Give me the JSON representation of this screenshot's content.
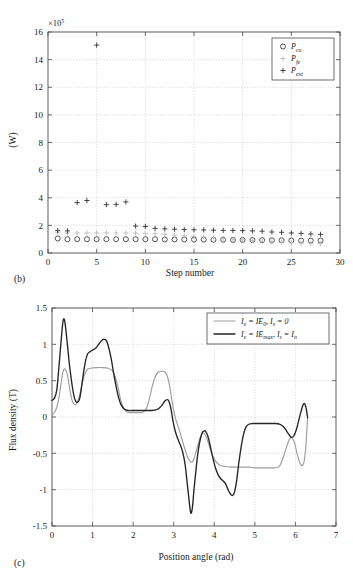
{
  "figure": {
    "panel_b_label": "(b)",
    "panel_c_label": "(c)"
  },
  "chart_data": [
    {
      "id": "panel-b",
      "type": "scatter",
      "title": "",
      "xlabel": "Step number",
      "ylabel": "(W)",
      "y_exponent_label": "×10",
      "y_exponent_sup": "5",
      "xlim": [
        0,
        30
      ],
      "ylim": [
        0,
        16
      ],
      "xticks": [
        0,
        5,
        10,
        15,
        20,
        25,
        30
      ],
      "yticks": [
        0,
        2,
        4,
        6,
        8,
        10,
        12,
        14,
        16
      ],
      "grid": true,
      "legend_position": "top-right",
      "legend": [
        {
          "marker": "circle",
          "base": "P",
          "sub": "cu"
        },
        {
          "marker": "plus-gray",
          "base": "P",
          "sub": "fe"
        },
        {
          "marker": "plus",
          "base": "P",
          "sub": "ext"
        }
      ],
      "x": [
        1,
        2,
        3,
        4,
        5,
        6,
        7,
        8,
        9,
        10,
        11,
        12,
        13,
        14,
        15,
        16,
        17,
        18,
        19,
        20,
        21,
        22,
        23,
        24,
        25,
        26,
        27,
        28
      ],
      "series": [
        {
          "name": "P_cu",
          "marker": "circle",
          "values": [
            1.05,
            1.0,
            1.0,
            1.0,
            1.0,
            1.0,
            1.0,
            1.0,
            1.0,
            1.0,
            1.0,
            0.98,
            0.98,
            0.98,
            0.97,
            0.97,
            0.96,
            0.96,
            0.95,
            0.95,
            0.94,
            0.93,
            0.92,
            0.92,
            0.91,
            0.9,
            0.9,
            0.9
          ]
        },
        {
          "name": "P_fe",
          "marker": "plus-gray",
          "values": [
            1.5,
            1.45,
            1.45,
            1.45,
            1.45,
            1.45,
            1.45,
            1.45,
            1.45,
            1.42,
            1.4,
            1.35,
            1.3,
            1.25,
            1.2,
            1.15,
            1.1,
            1.05,
            1.0,
            0.95,
            0.9,
            0.85,
            0.8,
            0.78,
            0.75,
            0.72,
            0.7,
            0.68
          ]
        },
        {
          "name": "P_ext",
          "marker": "plus",
          "values": [
            1.62,
            1.6,
            3.65,
            3.8,
            15.05,
            3.5,
            3.52,
            3.7,
            1.95,
            1.92,
            1.78,
            1.75,
            1.72,
            1.7,
            1.68,
            1.67,
            1.65,
            1.64,
            1.63,
            1.62,
            1.6,
            1.58,
            1.52,
            1.5,
            1.45,
            1.42,
            1.38,
            1.35
          ]
        }
      ]
    },
    {
      "id": "panel-c",
      "type": "line",
      "title": "",
      "xlabel": "Position angle (rad)",
      "ylabel": "Flux density (T)",
      "xlim": [
        0,
        7
      ],
      "ylim": [
        -1.5,
        1.5
      ],
      "xticks": [
        0,
        1,
        2,
        3,
        4,
        5,
        6,
        7
      ],
      "yticks": [
        -1.5,
        -1,
        -0.5,
        0,
        0.5,
        1,
        1.5
      ],
      "ytick_labels": [
        "-1.5",
        "-1",
        "-0.5",
        "0",
        "0.5",
        "1",
        "1.5"
      ],
      "grid": true,
      "legend_position": "top-right",
      "legend": [
        {
          "color": "#9d9d9d",
          "label_parts": [
            "I",
            "e",
            " = IE",
            "0",
            ", I",
            "s",
            " = 0"
          ]
        },
        {
          "color": "#242424",
          "label_parts": [
            "I",
            "e",
            " = IE",
            "max",
            ", I",
            "s",
            " = I",
            "n"
          ]
        }
      ],
      "series": [
        {
          "name": "Ie = IE0, Is = 0",
          "color": "#9d9d9d",
          "points": [
            [
              0.0,
              0.03
            ],
            [
              0.08,
              0.08
            ],
            [
              0.15,
              0.2
            ],
            [
              0.22,
              0.45
            ],
            [
              0.27,
              0.62
            ],
            [
              0.32,
              0.66
            ],
            [
              0.38,
              0.58
            ],
            [
              0.44,
              0.38
            ],
            [
              0.5,
              0.22
            ],
            [
              0.56,
              0.17
            ],
            [
              0.62,
              0.2
            ],
            [
              0.68,
              0.3
            ],
            [
              0.74,
              0.45
            ],
            [
              0.8,
              0.58
            ],
            [
              0.86,
              0.65
            ],
            [
              0.95,
              0.67
            ],
            [
              1.1,
              0.68
            ],
            [
              1.25,
              0.68
            ],
            [
              1.38,
              0.67
            ],
            [
              1.48,
              0.64
            ],
            [
              1.56,
              0.55
            ],
            [
              1.63,
              0.4
            ],
            [
              1.7,
              0.22
            ],
            [
              1.77,
              0.12
            ],
            [
              1.85,
              0.07
            ],
            [
              1.95,
              0.06
            ],
            [
              2.05,
              0.06
            ],
            [
              2.15,
              0.06
            ],
            [
              2.25,
              0.07
            ],
            [
              2.33,
              0.12
            ],
            [
              2.4,
              0.25
            ],
            [
              2.47,
              0.42
            ],
            [
              2.55,
              0.56
            ],
            [
              2.62,
              0.62
            ],
            [
              2.7,
              0.63
            ],
            [
              2.78,
              0.62
            ],
            [
              2.85,
              0.55
            ],
            [
              2.9,
              0.42
            ],
            [
              2.95,
              0.25
            ],
            [
              3.0,
              0.08
            ],
            [
              3.06,
              -0.05
            ],
            [
              3.12,
              -0.15
            ],
            [
              3.2,
              -0.3
            ],
            [
              3.28,
              -0.45
            ],
            [
              3.35,
              -0.56
            ],
            [
              3.42,
              -0.62
            ],
            [
              3.48,
              -0.6
            ],
            [
              3.54,
              -0.5
            ],
            [
              3.6,
              -0.38
            ],
            [
              3.66,
              -0.27
            ],
            [
              3.72,
              -0.22
            ],
            [
              3.78,
              -0.25
            ],
            [
              3.85,
              -0.35
            ],
            [
              3.92,
              -0.48
            ],
            [
              4.0,
              -0.58
            ],
            [
              4.08,
              -0.64
            ],
            [
              4.16,
              -0.67
            ],
            [
              4.26,
              -0.68
            ],
            [
              4.4,
              -0.69
            ],
            [
              4.55,
              -0.69
            ],
            [
              4.7,
              -0.69
            ],
            [
              4.85,
              -0.69
            ],
            [
              5.0,
              -0.7
            ],
            [
              5.15,
              -0.7
            ],
            [
              5.3,
              -0.7
            ],
            [
              5.45,
              -0.7
            ],
            [
              5.58,
              -0.69
            ],
            [
              5.66,
              -0.62
            ],
            [
              5.73,
              -0.5
            ],
            [
              5.8,
              -0.38
            ],
            [
              5.86,
              -0.3
            ],
            [
              5.92,
              -0.29
            ],
            [
              5.98,
              -0.36
            ],
            [
              6.04,
              -0.5
            ],
            [
              6.1,
              -0.62
            ],
            [
              6.16,
              -0.67
            ],
            [
              6.21,
              -0.62
            ],
            [
              6.25,
              -0.45
            ],
            [
              6.28,
              -0.2
            ],
            [
              6.3,
              -0.02
            ]
          ]
        },
        {
          "name": "Ie = IEmax, Is = In",
          "color": "#242424",
          "points": [
            [
              0.0,
              0.23
            ],
            [
              0.06,
              0.26
            ],
            [
              0.12,
              0.38
            ],
            [
              0.18,
              0.75
            ],
            [
              0.24,
              1.15
            ],
            [
              0.28,
              1.34
            ],
            [
              0.32,
              1.3
            ],
            [
              0.37,
              1.05
            ],
            [
              0.43,
              0.72
            ],
            [
              0.5,
              0.42
            ],
            [
              0.56,
              0.25
            ],
            [
              0.62,
              0.2
            ],
            [
              0.68,
              0.25
            ],
            [
              0.73,
              0.42
            ],
            [
              0.78,
              0.62
            ],
            [
              0.83,
              0.78
            ],
            [
              0.88,
              0.87
            ],
            [
              0.94,
              0.9
            ],
            [
              1.0,
              0.92
            ],
            [
              1.08,
              0.95
            ],
            [
              1.15,
              1.0
            ],
            [
              1.22,
              1.05
            ],
            [
              1.28,
              1.07
            ],
            [
              1.34,
              1.05
            ],
            [
              1.4,
              0.95
            ],
            [
              1.46,
              0.8
            ],
            [
              1.52,
              0.6
            ],
            [
              1.58,
              0.42
            ],
            [
              1.64,
              0.27
            ],
            [
              1.7,
              0.17
            ],
            [
              1.78,
              0.11
            ],
            [
              1.88,
              0.09
            ],
            [
              2.0,
              0.09
            ],
            [
              2.15,
              0.09
            ],
            [
              2.3,
              0.09
            ],
            [
              2.45,
              0.09
            ],
            [
              2.58,
              0.1
            ],
            [
              2.66,
              0.13
            ],
            [
              2.72,
              0.17
            ],
            [
              2.78,
              0.22
            ],
            [
              2.84,
              0.24
            ],
            [
              2.88,
              0.22
            ],
            [
              2.93,
              0.12
            ],
            [
              2.98,
              -0.05
            ],
            [
              3.04,
              -0.2
            ],
            [
              3.1,
              -0.3
            ],
            [
              3.16,
              -0.38
            ],
            [
              3.22,
              -0.48
            ],
            [
              3.28,
              -0.65
            ],
            [
              3.33,
              -0.9
            ],
            [
              3.38,
              -1.15
            ],
            [
              3.42,
              -1.32
            ],
            [
              3.46,
              -1.25
            ],
            [
              3.5,
              -1.0
            ],
            [
              3.55,
              -0.72
            ],
            [
              3.6,
              -0.48
            ],
            [
              3.65,
              -0.32
            ],
            [
              3.7,
              -0.22
            ],
            [
              3.75,
              -0.19
            ],
            [
              3.8,
              -0.21
            ],
            [
              3.86,
              -0.3
            ],
            [
              3.92,
              -0.45
            ],
            [
              3.98,
              -0.6
            ],
            [
              4.04,
              -0.72
            ],
            [
              4.1,
              -0.8
            ],
            [
              4.16,
              -0.85
            ],
            [
              4.22,
              -0.88
            ],
            [
              4.28,
              -0.92
            ],
            [
              4.34,
              -1.0
            ],
            [
              4.4,
              -1.06
            ],
            [
              4.45,
              -1.08
            ],
            [
              4.5,
              -1.03
            ],
            [
              4.55,
              -0.88
            ],
            [
              4.6,
              -0.65
            ],
            [
              4.66,
              -0.42
            ],
            [
              4.72,
              -0.24
            ],
            [
              4.78,
              -0.14
            ],
            [
              4.85,
              -0.1
            ],
            [
              4.95,
              -0.09
            ],
            [
              5.1,
              -0.09
            ],
            [
              5.3,
              -0.09
            ],
            [
              5.5,
              -0.09
            ],
            [
              5.62,
              -0.1
            ],
            [
              5.7,
              -0.13
            ],
            [
              5.78,
              -0.19
            ],
            [
              5.85,
              -0.25
            ],
            [
              5.9,
              -0.28
            ],
            [
              5.96,
              -0.26
            ],
            [
              6.02,
              -0.18
            ],
            [
              6.08,
              -0.05
            ],
            [
              6.14,
              0.08
            ],
            [
              6.19,
              0.17
            ],
            [
              6.23,
              0.18
            ],
            [
              6.27,
              0.1
            ],
            [
              6.3,
              -0.01
            ]
          ]
        }
      ]
    }
  ]
}
